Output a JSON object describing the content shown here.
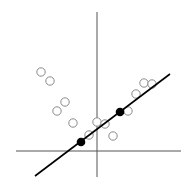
{
  "diagram": {
    "title": "",
    "axes": {
      "x_axis": {
        "x1": 16,
        "y1": 151,
        "x2": 181,
        "y2": 151,
        "color": "#555555"
      },
      "y_axis": {
        "x1": 97,
        "y1": 12,
        "x2": 97,
        "y2": 177,
        "color": "#555555"
      }
    },
    "line": {
      "x1": 35,
      "y1": 176,
      "x2": 170,
      "y2": 74,
      "color": "#000000"
    },
    "filled_points": [
      {
        "x": 81,
        "y": 142
      },
      {
        "x": 120,
        "y": 112
      }
    ],
    "hollow_points": [
      {
        "x": 41,
        "y": 72
      },
      {
        "x": 50,
        "y": 81
      },
      {
        "x": 65,
        "y": 102
      },
      {
        "x": 57,
        "y": 111
      },
      {
        "x": 73,
        "y": 123
      },
      {
        "x": 97,
        "y": 122
      },
      {
        "x": 105,
        "y": 124
      },
      {
        "x": 89,
        "y": 135
      },
      {
        "x": 113,
        "y": 136
      },
      {
        "x": 128,
        "y": 111
      },
      {
        "x": 136,
        "y": 94
      },
      {
        "x": 144,
        "y": 83
      },
      {
        "x": 152,
        "y": 84
      }
    ],
    "colors": {
      "hollow_stroke": "#8a8a8a",
      "filled": "#000000"
    }
  }
}
